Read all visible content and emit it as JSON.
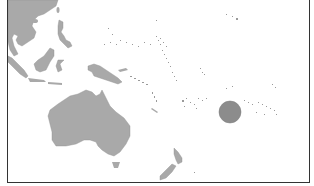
{
  "map": {
    "region": "Oceania / Western Pacific",
    "colors": {
      "background": "#ffffff",
      "land": "#a9a9a9",
      "land_stroke": "#8f8f8f",
      "highlight": "#8c8c8c",
      "highlight_stroke": "#7a7a7a",
      "frame": "#333333"
    },
    "landmasses": [
      "Southeast Asia mainland",
      "Borneo",
      "Philippines",
      "Sulawesi",
      "New Guinea",
      "Australia",
      "Tasmania",
      "New Zealand",
      "Pacific island chains"
    ],
    "highlight_marker": {
      "shape": "circle",
      "cx": 230,
      "cy": 112,
      "r": 11
    }
  }
}
